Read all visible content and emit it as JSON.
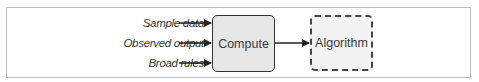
{
  "diagram": {
    "inputs": [
      {
        "label": "Sample data"
      },
      {
        "label": "Observed output"
      },
      {
        "label": "Broad rules"
      }
    ],
    "process": {
      "label": "Compute"
    },
    "output": {
      "label": "Algorithm"
    },
    "colors": {
      "frame_border": "#bdbdbd",
      "compute_fill": "#e6e6e6",
      "algorithm_fill": "#f3f3f3",
      "stroke": "#222222"
    }
  }
}
